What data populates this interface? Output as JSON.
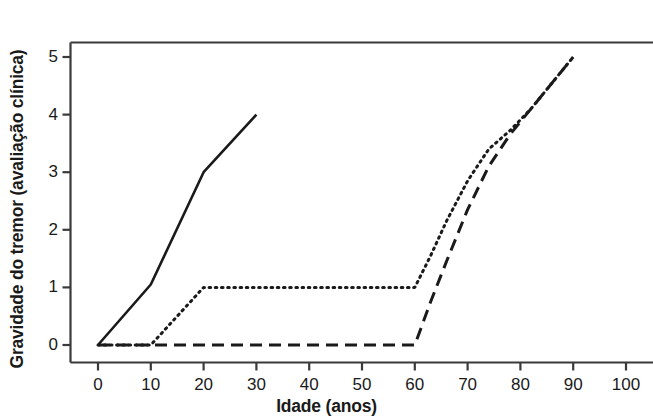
{
  "chart_data": {
    "type": "line",
    "title": "",
    "xlabel": "Idade (anos)",
    "ylabel": "Gravidade do tremor (avaliação clínica)",
    "xlim": [
      -3,
      106
    ],
    "ylim": [
      -0.18,
      5.55
    ],
    "xticks": [
      0,
      10,
      20,
      30,
      40,
      50,
      60,
      70,
      80,
      90,
      100
    ],
    "xtick_labels": [
      "0",
      "10",
      "20",
      "30",
      "40",
      "50",
      "60",
      "70",
      "80",
      "90",
      "100"
    ],
    "yticks": [
      0,
      1,
      2,
      3,
      4,
      5
    ],
    "ytick_labels": [
      "0",
      "1",
      "2",
      "3",
      "4",
      "5"
    ],
    "grid": false,
    "legend": "none",
    "line_color": "#1a1a1a",
    "frame_color": "#3a3a3a",
    "series": [
      {
        "name": "solid",
        "style": "solid",
        "x": [
          0,
          10,
          20,
          30
        ],
        "y": [
          0,
          1.05,
          3.0,
          4.0
        ]
      },
      {
        "name": "dotted",
        "style": "dotted",
        "x": [
          0,
          10,
          20,
          60,
          63,
          66,
          70,
          74,
          78,
          82,
          86,
          90
        ],
        "y": [
          0,
          0,
          1.0,
          1.0,
          1.55,
          2.15,
          2.85,
          3.4,
          3.72,
          4.1,
          4.55,
          5.0
        ]
      },
      {
        "name": "dashed",
        "style": "dashed",
        "x": [
          0,
          60,
          63,
          66,
          70,
          74,
          78,
          82,
          86,
          90
        ],
        "y": [
          0,
          0,
          0.75,
          1.45,
          2.35,
          3.1,
          3.65,
          4.1,
          4.55,
          5.0
        ]
      }
    ]
  }
}
